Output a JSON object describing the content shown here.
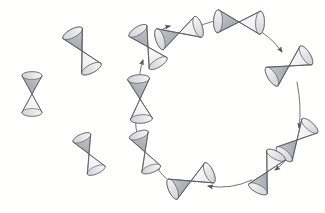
{
  "figure": {
    "background_color": "#fffffe",
    "stroke_color": "#5b5b63",
    "fill_light": "#f2f2f2",
    "fill_shaded": "#b9b9bf",
    "canvas": {
      "width": 325,
      "height": 213
    }
  },
  "ring": {
    "name": "bowtie-ring",
    "center": {
      "x": 214,
      "y": 103
    },
    "radius_x": 76,
    "radius_y": 82,
    "direction": "clockwise",
    "node_count": 9,
    "arrow_count": 9
  },
  "nodes": [
    {
      "id": "node-1",
      "label": "",
      "x": 179,
      "y": 33,
      "rotation": -18,
      "scale": 1.0,
      "orientation": "horizontal"
    },
    {
      "id": "node-2",
      "label": "",
      "x": 239,
      "y": 22,
      "rotation": 2,
      "scale": 1.05,
      "orientation": "horizontal"
    },
    {
      "id": "node-3",
      "label": "",
      "x": 289,
      "y": 66,
      "rotation": -32,
      "scale": 1.0,
      "orientation": "tilted"
    },
    {
      "id": "node-4",
      "label": "",
      "x": 297,
      "y": 140,
      "rotation": -48,
      "scale": 0.95,
      "orientation": "tilted"
    },
    {
      "id": "node-5",
      "label": "",
      "x": 267,
      "y": 172,
      "rotation": -62,
      "scale": 0.95,
      "orientation": "tilted"
    },
    {
      "id": "node-6",
      "label": "",
      "x": 191,
      "y": 181,
      "rotation": -24,
      "scale": 1.0,
      "orientation": "horizontal"
    },
    {
      "id": "node-7",
      "label": "",
      "x": 145,
      "y": 152,
      "rotation": 70,
      "scale": 0.9,
      "orientation": "tilted"
    },
    {
      "id": "node-8",
      "label": "",
      "x": 140,
      "y": 99,
      "rotation": 86,
      "scale": 1.0,
      "orientation": "vertical"
    },
    {
      "id": "node-9",
      "label": "",
      "x": 148,
      "y": 47,
      "rotation": 58,
      "scale": 0.95,
      "orientation": "tilted"
    }
  ],
  "isolated_nodes": [
    {
      "id": "isolated-1",
      "label": "",
      "x": 32,
      "y": 94,
      "rotation": 90,
      "scale": 0.92,
      "orientation": "vertical"
    },
    {
      "id": "isolated-2",
      "label": "",
      "x": 82,
      "y": 51,
      "rotation": 62,
      "scale": 1.0,
      "orientation": "tilted"
    },
    {
      "id": "isolated-3",
      "label": "",
      "x": 89,
      "y": 154,
      "rotation": 66,
      "scale": 0.88,
      "orientation": "tilted"
    }
  ],
  "arrows": [
    {
      "id": "arrow-1",
      "from": "node-1",
      "to": "node-2",
      "direction": "right"
    },
    {
      "id": "arrow-2",
      "from": "node-2",
      "to": "node-3",
      "direction": "down-right"
    },
    {
      "id": "arrow-3",
      "from": "node-3",
      "to": "node-4",
      "direction": "down"
    },
    {
      "id": "arrow-4",
      "from": "node-4",
      "to": "node-5",
      "direction": "down-left"
    },
    {
      "id": "arrow-5",
      "from": "node-5",
      "to": "node-6",
      "direction": "left"
    },
    {
      "id": "arrow-6",
      "from": "node-6",
      "to": "node-7",
      "direction": "up-left"
    },
    {
      "id": "arrow-7",
      "from": "node-7",
      "to": "node-8",
      "direction": "up"
    },
    {
      "id": "arrow-8",
      "from": "node-8",
      "to": "node-9",
      "direction": "up"
    },
    {
      "id": "arrow-9",
      "from": "node-9",
      "to": "node-1",
      "direction": "up-right"
    }
  ]
}
